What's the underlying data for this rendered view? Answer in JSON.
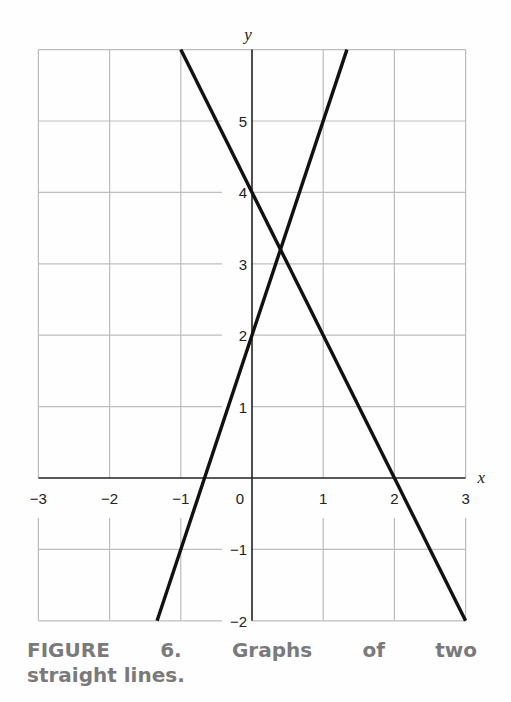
{
  "chart_data": {
    "type": "line",
    "title": "",
    "xlabel": "x",
    "ylabel": "y",
    "xlim": [
      -3,
      3
    ],
    "ylim": [
      -2,
      6
    ],
    "grid": true,
    "x_ticks": [
      "−3",
      "−2",
      "−1",
      "0",
      "1",
      "2",
      "3"
    ],
    "y_ticks": [
      "−2",
      "−1",
      "1",
      "2",
      "3",
      "4",
      "5"
    ],
    "series": [
      {
        "name": "line 1 (y = 4 − 2x)",
        "slope": -2,
        "intercept": 4,
        "x": [
          -1,
          3
        ],
        "y": [
          6,
          -2
        ]
      },
      {
        "name": "line 2 (y = 3x + 2)",
        "slope": 3,
        "intercept": 2,
        "x": [
          -1.333,
          1.333
        ],
        "y": [
          -2,
          6
        ]
      }
    ],
    "intersection": {
      "x": 0.4,
      "y": 3.2
    },
    "legend": "none"
  },
  "caption": {
    "words_line1": [
      "FIGURE",
      "6.",
      "Graphs",
      "of",
      "two"
    ],
    "line2": "straight lines."
  },
  "colors": {
    "grid": "#bdbdbd",
    "axis": "#222222",
    "line": "#111111",
    "caption": "#7a7a7a"
  }
}
